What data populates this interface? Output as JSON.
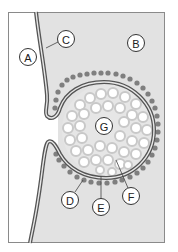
{
  "diagram": {
    "type": "exocytosis / endocytosis membrane fusion diagram",
    "colors": {
      "frame": "#8a8a8a",
      "region_a_fill": "#ffffff",
      "region_b_fill": "#e2e2e2",
      "membrane_stroke": "#555555",
      "vesicle_interior": "#e6e6e6",
      "granule_fill": "#ffffff",
      "granule_ring": "#c8c8c8",
      "dot_fill": "#7f7f7f",
      "label_fill": "#ffffff",
      "label_stroke": "#333333"
    },
    "labels": [
      {
        "id": "A",
        "text": "A",
        "x": 28,
        "y": 57
      },
      {
        "id": "B",
        "text": "B",
        "x": 136,
        "y": 43
      },
      {
        "id": "C",
        "text": "C",
        "x": 66,
        "y": 39
      },
      {
        "id": "D",
        "text": "D",
        "x": 70,
        "y": 200
      },
      {
        "id": "E",
        "text": "E",
        "x": 101,
        "y": 207
      },
      {
        "id": "F",
        "text": "F",
        "x": 131,
        "y": 196
      },
      {
        "id": "G",
        "text": "G",
        "x": 104,
        "y": 126
      }
    ]
  }
}
